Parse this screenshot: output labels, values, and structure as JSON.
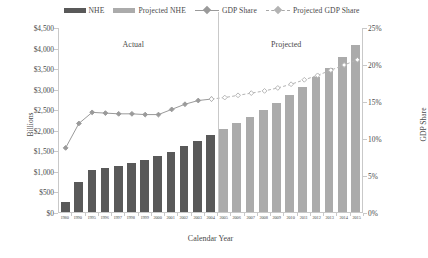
{
  "legend": [
    {
      "label": "NHE",
      "kind": "swatch",
      "color": "#595959"
    },
    {
      "label": "Projected NHE",
      "kind": "swatch",
      "color": "#ababab"
    },
    {
      "label": "GDP Share",
      "kind": "line-solid",
      "color": "#9a9a9a"
    },
    {
      "label": "Projected GDP Share",
      "kind": "line-dashed",
      "color": "#b3b3b3"
    }
  ],
  "annotations": {
    "actual": "Actual",
    "projected": "Projected"
  },
  "axes": {
    "left_title": "Billions",
    "right_title": "GDP Share",
    "x_title": "Calendar Year",
    "left_ticks": [
      "$0",
      "$500",
      "$1,000",
      "$1,500",
      "$2,000",
      "$2,500",
      "$3,000",
      "$3,500",
      "$4,000",
      "$4,500"
    ],
    "right_ticks": [
      "0%",
      "5%",
      "10%",
      "15%",
      "20%",
      "25%"
    ]
  },
  "chart_data": {
    "type": "bar",
    "title": "",
    "subtitle": "",
    "xlabel": "Calendar Year",
    "ylabel": "Billions",
    "y2label": "GDP Share",
    "ylim": [
      0,
      4500
    ],
    "y2lim": [
      0,
      25
    ],
    "grid": false,
    "legend_position": "top",
    "categories": [
      "1980",
      "1990",
      "1995",
      "1996",
      "1997",
      "1998",
      "1999",
      "2000",
      "2001",
      "2002",
      "2003",
      "2004",
      "2005",
      "2006",
      "2007",
      "2008",
      "2009",
      "2010",
      "2011",
      "2012",
      "2013",
      "2014",
      "2015"
    ],
    "actual_count": 12,
    "divider_after_category": "2004",
    "series": [
      {
        "name": "NHE",
        "type": "bar",
        "axis": "left",
        "color": "#595959",
        "unit": "Billions",
        "values": [
          255,
          724,
          1017,
          1069,
          1125,
          1190,
          1265,
          1353,
          1470,
          1603,
          1733,
          1878,
          null,
          null,
          null,
          null,
          null,
          null,
          null,
          null,
          null,
          null,
          null
        ]
      },
      {
        "name": "Projected NHE",
        "type": "bar",
        "axis": "left",
        "color": "#ababab",
        "unit": "Billions",
        "values": [
          null,
          null,
          null,
          null,
          null,
          null,
          null,
          null,
          null,
          null,
          null,
          null,
          2016,
          2164,
          2320,
          2486,
          2660,
          2847,
          3050,
          3273,
          3513,
          3776,
          4064
        ]
      },
      {
        "name": "GDP Share",
        "type": "line",
        "axis": "right",
        "color": "#9a9a9a",
        "marker": "diamond",
        "unit": "%",
        "values": [
          8.8,
          12.1,
          13.6,
          13.5,
          13.4,
          13.4,
          13.3,
          13.3,
          14.0,
          14.7,
          15.2,
          15.4,
          null,
          null,
          null,
          null,
          null,
          null,
          null,
          null,
          null,
          null,
          null
        ]
      },
      {
        "name": "Projected GDP Share",
        "type": "line",
        "axis": "right",
        "color": "#b3b3b3",
        "marker": "diamond-open",
        "style": "dashed",
        "unit": "%",
        "values": [
          null,
          null,
          null,
          null,
          null,
          null,
          null,
          null,
          null,
          null,
          null,
          15.4,
          15.6,
          15.9,
          16.2,
          16.5,
          16.9,
          17.4,
          18.0,
          18.6,
          19.3,
          20.0,
          20.7
        ]
      }
    ]
  }
}
